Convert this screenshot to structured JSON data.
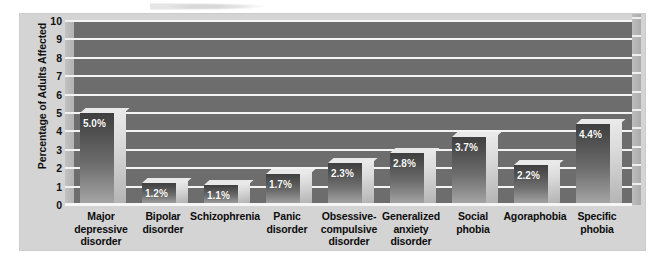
{
  "chart_data": {
    "type": "bar",
    "title": "",
    "subtitle": "",
    "xlabel": "",
    "ylabel": "Percentage of Adults Affected",
    "ylim": [
      0,
      10
    ],
    "ytick_values": [
      10,
      9,
      8,
      7,
      6,
      5,
      4,
      3,
      2,
      1,
      0
    ],
    "ytick_labels": [
      "10",
      "9",
      "8",
      "7",
      "6",
      "5",
      "4",
      "3",
      "2",
      "1",
      "0"
    ],
    "grid": "horizontal",
    "legend": "none",
    "style": "3d-bar",
    "categories": [
      "Major depressive disorder",
      "Bipolar disorder",
      "Schizophrenia",
      "Panic disorder",
      "Obsessive-compulsive disorder",
      "Generalized anxiety disorder",
      "Social phobia",
      "Agoraphobia",
      "Specific phobia"
    ],
    "category_lines": [
      [
        "Major",
        "depressive",
        "disorder"
      ],
      [
        "Bipolar",
        "disorder"
      ],
      [
        "Schizophrenia"
      ],
      [
        "Panic",
        "disorder"
      ],
      [
        "Obsessive-",
        "compulsive",
        "disorder"
      ],
      [
        "Generalized",
        "anxiety",
        "disorder"
      ],
      [
        "Social",
        "phobia"
      ],
      [
        "Agoraphobia"
      ],
      [
        "Specific",
        "phobia"
      ]
    ],
    "values": [
      5.0,
      1.2,
      1.1,
      1.7,
      2.3,
      2.8,
      3.7,
      2.2,
      4.4
    ],
    "value_labels": [
      "5.0%",
      "1.2%",
      "1.1%",
      "1.7%",
      "2.3%",
      "2.8%",
      "3.7%",
      "2.2%",
      "4.4%"
    ]
  },
  "colors": {
    "figure_background": "#d4d4d4",
    "page_background": "#ffffff",
    "plot_background": "#6d6d6d",
    "gridline": "#f4f4f4",
    "bar_front_top": "#3f3f3f",
    "bar_front_bottom": "#a8a8a8",
    "bar_side": "#dcdcdc",
    "value_label_text": "#ffffff",
    "axis_text": "#111111"
  }
}
